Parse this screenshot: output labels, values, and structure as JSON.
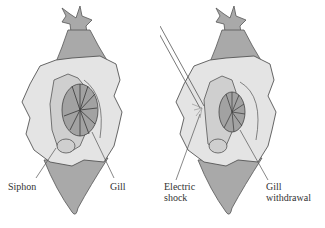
{
  "colors": {
    "body_fill": "#a9a9a9",
    "mantle_fill": "#e4e4e4",
    "inner_fill": "#cfcfcf",
    "gill_fill": "#a2a2a2",
    "outline": "#555555",
    "background": "#ffffff"
  },
  "panels": [
    {
      "name": "before",
      "labels": {
        "left": "Siphon",
        "right": "Gill"
      }
    },
    {
      "name": "after",
      "labels": {
        "left_line1": "Electric",
        "left_line2": "shock",
        "right_line1": "Gill",
        "right_line2": "withdrawal"
      }
    }
  ]
}
